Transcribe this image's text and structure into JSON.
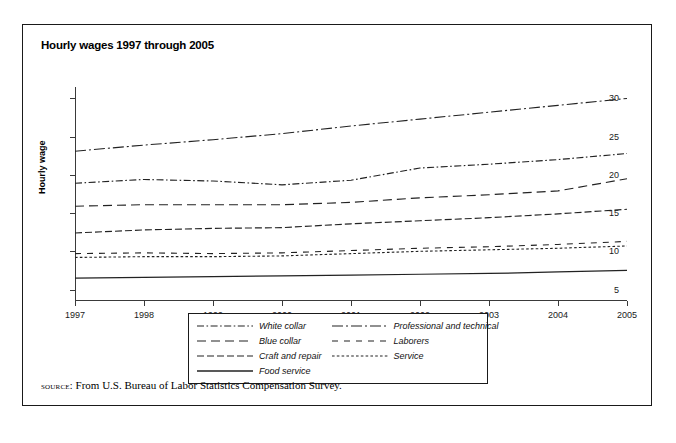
{
  "figure": {
    "title": "Hourly wages 1997 through 2005",
    "source_label": "source:",
    "source_text": "From U.S. Bureau of Labor Statistics Compensation Survey."
  },
  "axes": {
    "x_title": "Year",
    "y_title": "Hourly wage",
    "y_ticks": [
      "5",
      "10",
      "15",
      "20",
      "25",
      "30"
    ],
    "x_ticks": [
      "1997",
      "1998",
      "1999",
      "2000",
      "2001",
      "2002",
      "2003",
      "2004",
      "2005"
    ]
  },
  "legend": {
    "items": [
      {
        "label": "White collar",
        "style": "dash-dot",
        "column": "left"
      },
      {
        "label": "Blue collar",
        "style": "long-dash",
        "column": "left"
      },
      {
        "label": "Craft and repair",
        "style": "medium-dash",
        "column": "left"
      },
      {
        "label": "Food service",
        "style": "solid",
        "column": "left"
      },
      {
        "label": "Professional and technical",
        "style": "dash-dot-long",
        "column": "right"
      },
      {
        "label": "Laborers",
        "style": "spaced-dash",
        "column": "right"
      },
      {
        "label": "Service",
        "style": "fine-dot",
        "column": "right"
      }
    ]
  },
  "chart_data": {
    "type": "line",
    "title": "Hourly wages 1997 through 2005",
    "xlabel": "Year",
    "ylabel": "Hourly wage",
    "xlim": [
      1997,
      2005
    ],
    "ylim": [
      3.5,
      31.5
    ],
    "yticks": [
      5,
      10,
      15,
      20,
      25,
      30
    ],
    "grid": false,
    "legend_position": "below-plot",
    "x": [
      1997,
      1998,
      1999,
      2000,
      2001,
      2002,
      2003,
      2004,
      2005
    ],
    "series": [
      {
        "name": "Professional and technical",
        "style": "dash-dot-long",
        "values": [
          23.1,
          23.9,
          24.6,
          25.4,
          26.4,
          27.3,
          28.2,
          29.1,
          30.0
        ]
      },
      {
        "name": "White collar",
        "style": "dash-dot",
        "values": [
          18.9,
          19.4,
          19.2,
          18.7,
          19.3,
          20.9,
          21.4,
          22.0,
          22.8
        ]
      },
      {
        "name": "Blue collar",
        "style": "long-dash",
        "values": [
          15.9,
          16.1,
          16.1,
          16.1,
          16.4,
          17.0,
          17.4,
          17.9,
          19.5
        ]
      },
      {
        "name": "Craft and repair",
        "style": "medium-dash",
        "values": [
          12.4,
          12.8,
          13.0,
          13.1,
          13.6,
          14.0,
          14.4,
          14.9,
          15.5
        ]
      },
      {
        "name": "Laborers",
        "style": "spaced-dash",
        "values": [
          9.7,
          9.8,
          9.7,
          9.8,
          10.1,
          10.4,
          10.6,
          10.9,
          11.3
        ]
      },
      {
        "name": "Service",
        "style": "fine-dot",
        "values": [
          9.2,
          9.3,
          9.3,
          9.4,
          9.7,
          10.0,
          10.2,
          10.4,
          10.7
        ]
      },
      {
        "name": "Food service",
        "style": "solid",
        "values": [
          6.5,
          6.6,
          6.7,
          6.8,
          6.9,
          7.0,
          7.1,
          7.3,
          7.5
        ]
      }
    ]
  }
}
